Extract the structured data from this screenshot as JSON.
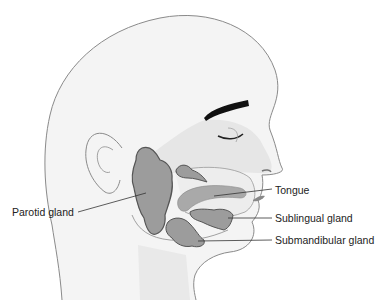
{
  "diagram": {
    "labels": [
      {
        "id": "parotid",
        "text": "Parotid gland"
      },
      {
        "id": "tongue",
        "text": "Tongue"
      },
      {
        "id": "sublingual",
        "text": "Sublingual gland"
      },
      {
        "id": "submandibular",
        "text": "Submandibular gland"
      }
    ],
    "colors": {
      "outline": "#8a8a8a",
      "skin": "#f4f4f4",
      "face_shade": "#e6e6e6",
      "gland_fill": "#9c9c9c",
      "gland_edge": "#555555",
      "tongue": "#a9a9a9",
      "eyebrow": "#111111"
    }
  }
}
